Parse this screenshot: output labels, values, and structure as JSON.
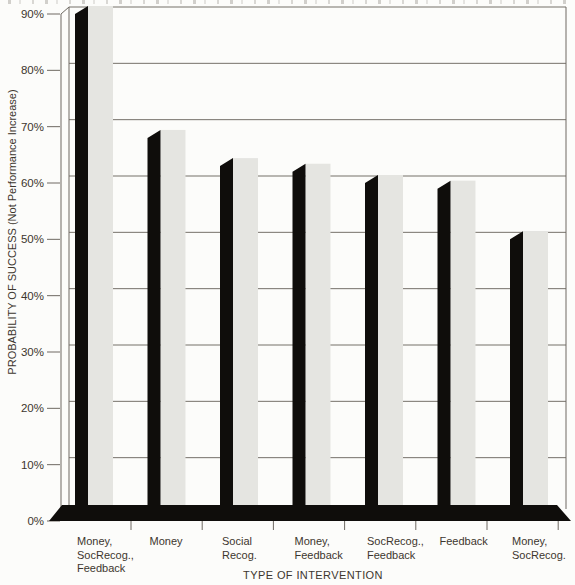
{
  "chart_data": {
    "type": "bar",
    "style": "3d-offset-shadow-bars",
    "title": "",
    "xlabel": "TYPE OF INTERVENTION",
    "ylabel": "PROBABILITY OF SUCCESS (Not Performance Increase)",
    "categories": [
      "Money, SocRecog., Feedback",
      "Money",
      "Social Recog.",
      "Money, Feedback",
      "SocRecog., Feedback",
      "Feedback",
      "Money, SocRecog."
    ],
    "category_label_lines": [
      [
        "Money,",
        "SocRecog.,",
        "Feedback"
      ],
      [
        "Money"
      ],
      [
        "Social",
        "Recog."
      ],
      [
        "Money,",
        "Feedback"
      ],
      [
        "SocRecog.,",
        "Feedback"
      ],
      [
        "Feedback"
      ],
      [
        "Money,",
        "SocRecog."
      ]
    ],
    "values": [
      90,
      68,
      63,
      62,
      60,
      59,
      50
    ],
    "unit": "%",
    "ylim": [
      0,
      90
    ],
    "ytick_step": 10,
    "ytick_labels": [
      "0%",
      "10%",
      "20%",
      "30%",
      "40%",
      "50%",
      "60%",
      "70%",
      "80%",
      "90%"
    ],
    "grid": true,
    "legend": null,
    "colors": {
      "background": "#fcfcfa",
      "bar_front": "#0f0d0b",
      "bar_side": "#e5e5e1",
      "gridline": "#757069",
      "axis_line": "#6e6962",
      "base_bar": "#0f0d0b",
      "text": "#3c362e"
    }
  }
}
